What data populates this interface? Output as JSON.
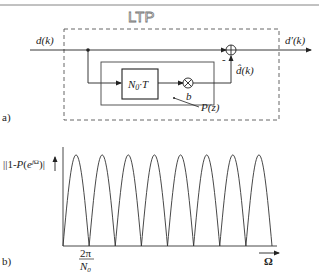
{
  "header": {
    "handwritten_note": "LTP"
  },
  "diagram_a": {
    "panel_label": "a)",
    "input_label": "d(k)",
    "output_label": "d′(k)",
    "delay_block_label": "N",
    "delay_block_sub": "0",
    "delay_block_suffix": "·T",
    "multiplier_gain_label": "b",
    "prediction_label": "d̂(k)",
    "filter_label": "P(z)",
    "sum_sign": "-",
    "sum_icon": "⊕",
    "multiplier_icon": "⊗"
  },
  "chart_data": {
    "type": "line",
    "panel_label": "b)",
    "ylabel": "|1-P(e^{jΩ})|",
    "xlabel": "Ω",
    "xtick_label_numerator": "2π",
    "xtick_label_denominator_main": "N",
    "xtick_label_denominator_sub": "0",
    "lobes": 8,
    "xlim_periods": [
      0,
      8
    ],
    "ylim": [
      0,
      1
    ],
    "peak_value": 0.92,
    "zeros_at_periods": [
      0,
      1,
      2,
      3,
      4,
      5,
      6,
      7,
      8
    ]
  }
}
